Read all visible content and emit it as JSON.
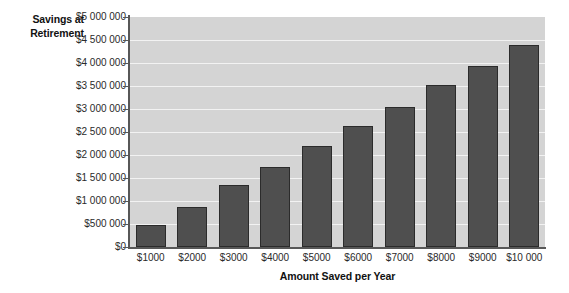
{
  "chart_data": {
    "type": "bar",
    "title": "",
    "subtitle": "",
    "xlabel": "Amount Saved per Year",
    "ylabel": "Savings at Retirement",
    "ylabel_lines": [
      "Savings at",
      "Retirement"
    ],
    "categories": [
      "$1000",
      "$2000",
      "$3000",
      "$4000",
      "$5000",
      "$6000",
      "$7000",
      "$8000",
      "$9000",
      "$10 000"
    ],
    "category_values": [
      1000,
      2000,
      3000,
      4000,
      5000,
      6000,
      7000,
      8000,
      9000,
      10000
    ],
    "values": [
      480000,
      880000,
      1350000,
      1750000,
      2200000,
      2620000,
      3050000,
      3520000,
      3930000,
      4400000
    ],
    "ylim": [
      0,
      5000000
    ],
    "ytick_values": [
      0,
      500000,
      1000000,
      1500000,
      2000000,
      2500000,
      3000000,
      3500000,
      4000000,
      4500000,
      5000000
    ],
    "ytick_labels": [
      "$0",
      "$500 000",
      "$1 000 000",
      "$1 500 000",
      "$2 000 000",
      "$2 500 000",
      "$3 000 000",
      "$3 500 000",
      "$4 000 000",
      "$4 500 000",
      "$5 000 000"
    ],
    "grid": true,
    "grid_axis": "y",
    "legend": false,
    "legend_position": "none",
    "series": [
      {
        "name": "Savings at Retirement",
        "values": [
          480000,
          880000,
          1350000,
          1750000,
          2200000,
          2620000,
          3050000,
          3520000,
          3930000,
          4400000
        ]
      }
    ],
    "colors": {
      "bar_fill": "#4f4f4f",
      "bar_border": "#2b2b2b",
      "plot_background": "#d4d4d4",
      "gridline": "#f2f2f2",
      "axis": "#575757",
      "page_background": "#ffffff",
      "text": "#1a1a1a"
    }
  }
}
